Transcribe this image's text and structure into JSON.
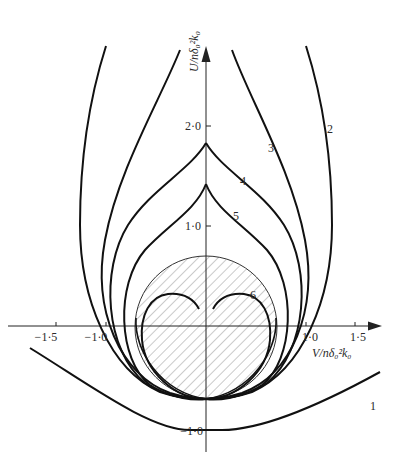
{
  "figure": {
    "type": "diagram",
    "axes": {
      "x_label": "V/nδ₀²k₀",
      "y_label": "U/nδ₀²k₀",
      "x_ticks": [
        {
          "value": -1.5,
          "label": "−1·5"
        },
        {
          "value": -1.0,
          "label": "−1·0"
        },
        {
          "value": 1.0,
          "label": "1·0"
        },
        {
          "value": 1.5,
          "label": "1·5"
        }
      ],
      "y_ticks": [
        {
          "value": 2.0,
          "label": "2·0"
        },
        {
          "value": 1.0,
          "label": "1·0"
        },
        {
          "value": -1.0,
          "label": "−1·0"
        }
      ]
    },
    "curves": [
      {
        "id": "1",
        "label": "1"
      },
      {
        "id": "2",
        "label": "2"
      },
      {
        "id": "3",
        "label": "3"
      },
      {
        "id": "4",
        "label": "4"
      },
      {
        "id": "5",
        "label": "5"
      },
      {
        "id": "6",
        "label": "6"
      }
    ],
    "shaded_region": {
      "shape": "circle",
      "pattern": "diagonal-hatch",
      "center_u": -0.32,
      "radius": 0.69
    },
    "colors": {
      "line": "#111111",
      "hatch": "#777777",
      "background": "#ffffff"
    }
  }
}
